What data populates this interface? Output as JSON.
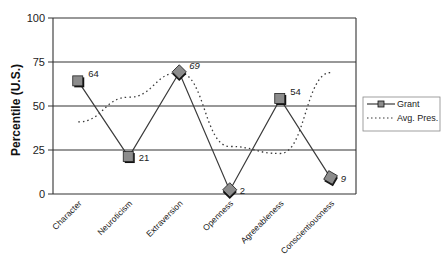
{
  "chart_data": {
    "type": "line",
    "title": "",
    "xlabel": "",
    "ylabel": "Percentile (U.S.)",
    "ylim": [
      0,
      100
    ],
    "yticks": [
      0,
      25,
      50,
      75,
      100
    ],
    "grid": true,
    "legend_position": "right",
    "categories": [
      "Character",
      "Neuroticism",
      "Extraversion",
      "Openness",
      "Agreeableness",
      "Conscientiousness"
    ],
    "series": [
      {
        "name": "Grant",
        "style": "solid",
        "marker": "square",
        "values": [
          64,
          21,
          69,
          2,
          54,
          9
        ],
        "data_labels": [
          "64",
          "21",
          "69",
          "2",
          "54",
          "9"
        ]
      },
      {
        "name": "Avg. Pres.",
        "style": "dotted",
        "marker": "none",
        "values": [
          41,
          55,
          69,
          27,
          23,
          69
        ]
      }
    ]
  },
  "colors": {
    "line": "#3a3a3a",
    "marker_fill": "#8c8c8c",
    "marker_shadow": "#111111",
    "grid": "#333333"
  }
}
